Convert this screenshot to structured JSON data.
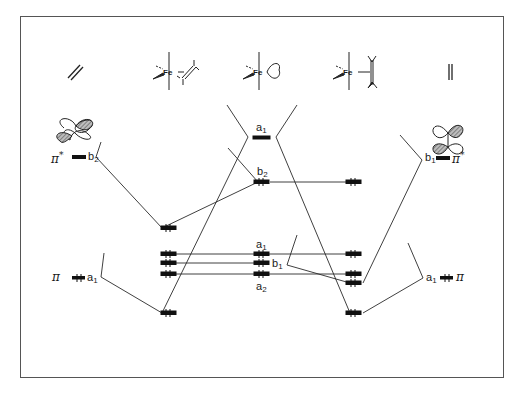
{
  "diagram": {
    "frame": {
      "x": 20,
      "y": 16,
      "w": 483,
      "h": 361,
      "color": "#555555"
    },
    "colors": {
      "line": "#2a2a2a",
      "level": "#111111",
      "hatch": "#777777",
      "background": "#ffffff"
    },
    "top_structures": [
      {
        "id": "ethylene-tilted",
        "label": "",
        "x": 75,
        "y": 72
      },
      {
        "id": "fe-olefin-inplane",
        "fe_label": "Fe",
        "x": 172,
        "y": 72
      },
      {
        "id": "fe-fragment",
        "fe_label": "Fe",
        "x": 262,
        "y": 72
      },
      {
        "id": "fe-olefin-upright",
        "fe_label": "Fe",
        "x": 352,
        "y": 72
      },
      {
        "id": "ethylene-vertical",
        "label": "",
        "x": 450,
        "y": 72
      }
    ],
    "left_ligand": {
      "pi_star": {
        "symbol": "π",
        "sup": "*",
        "sym_label": "b",
        "sym_sub": "2",
        "y": 157,
        "electrons": 0
      },
      "pi": {
        "symbol": "π",
        "sym_label": "a",
        "sym_sub": "1",
        "y": 278,
        "electrons": 2
      }
    },
    "right_ligand": {
      "pi_star": {
        "symbol": "π",
        "sup": "*",
        "sym_label": "b",
        "sym_sub": "1",
        "y": 158,
        "electrons": 0
      },
      "pi": {
        "symbol": "π",
        "sym_label": "a",
        "sym_sub": "1",
        "y": 278,
        "electrons": 2
      }
    },
    "center_fragment": {
      "levels": [
        {
          "label": "a",
          "sub": "1",
          "y": 137,
          "electrons": 0,
          "label_pos": "above"
        },
        {
          "label": "b",
          "sub": "2",
          "y": 182,
          "electrons": 2,
          "label_pos": "above"
        },
        {
          "label": "a",
          "sub": "1",
          "y": 254,
          "electrons": 2,
          "label_pos": "above"
        },
        {
          "label": "b",
          "sub": "1",
          "y": 263,
          "electrons": 2,
          "label_pos": "right"
        },
        {
          "label": "a",
          "sub": "2",
          "y": 274,
          "electrons": 2,
          "label_pos": "below"
        }
      ]
    },
    "left_complex": {
      "levels_y": [
        228,
        254,
        263,
        274,
        313
      ],
      "electrons": 2
    },
    "right_complex": {
      "levels_y": [
        182,
        254,
        274,
        283,
        313
      ],
      "electrons": 2
    }
  }
}
